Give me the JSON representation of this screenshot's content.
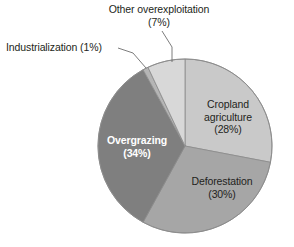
{
  "chart_data": {
    "type": "pie",
    "title": "",
    "subtitle": "",
    "xlabel": "",
    "ylabel": "",
    "legend_position": "none",
    "grid": false,
    "units": "percent",
    "total": 100,
    "categories": [
      "Cropland agriculture",
      "Deforestation",
      "Overgrazing",
      "Industrialization",
      "Other overexploitation"
    ],
    "values": [
      28,
      30,
      34,
      1,
      7
    ],
    "slices": [
      {
        "name": "Cropland agriculture",
        "value": 28,
        "label": "Cropland\nagriculture\n(28%)",
        "percent_text": "(28%)",
        "color": "#c9c9c9",
        "label_placement": "inside"
      },
      {
        "name": "Deforestation",
        "value": 30,
        "label": "Deforestation\n(30%)",
        "percent_text": "(30%)",
        "color": "#a6a6a6",
        "label_placement": "inside"
      },
      {
        "name": "Overgrazing",
        "value": 34,
        "label": "Overgrazing\n(34%)",
        "percent_text": "(34%)",
        "color": "#7f7f7f",
        "label_placement": "inside"
      },
      {
        "name": "Industrialization",
        "value": 1,
        "label": "Industrialization (1%)",
        "percent_text": "(1%)",
        "color": "#b5b5b5",
        "label_placement": "callout"
      },
      {
        "name": "Other overexploitation",
        "value": 7,
        "label": "Other overexploitation\n(7%)",
        "percent_text": "(7%)",
        "color": "#d8d8d8",
        "label_placement": "callout"
      }
    ]
  },
  "labels": {
    "other_overexploitation_line1": "Other overexploitation",
    "other_overexploitation_line2": "(7%)",
    "industrialization": "Industrialization (1%)",
    "cropland_line1": "Cropland",
    "cropland_line2": "agriculture",
    "cropland_line3": "(28%)",
    "deforestation_line1": "Deforestation",
    "deforestation_line2": "(30%)",
    "overgrazing_line1": "Overgrazing",
    "overgrazing_line2": "(34%)"
  },
  "colors": {
    "background": "#ffffff",
    "text": "#231f20",
    "inside_light_text": "#ffffff",
    "leader_line": "#6d6d6d",
    "slice_outline": "#8a8a8a",
    "cropland": "#c9c9c9",
    "deforestation": "#a6a6a6",
    "overgrazing": "#7f7f7f",
    "industrialization": "#b5b5b5",
    "other_overexploitation": "#d8d8d8"
  }
}
